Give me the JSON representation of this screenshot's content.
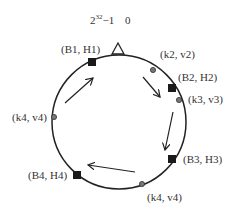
{
  "diagram": {
    "type": "consistent-hash-ring",
    "top_label": {
      "max": "2",
      "max_exp": "32",
      "max_suffix": "−1",
      "zero": "0"
    },
    "ring": {
      "cx": 119,
      "cy": 122,
      "r": 67,
      "stroke": "#222222"
    },
    "marker": {
      "shape": "triangle",
      "position": "top"
    },
    "nodes": [
      {
        "id": "B1",
        "label": "(B1, H1)",
        "x": 92,
        "y": 62
      },
      {
        "id": "B2",
        "label": "(B2, H2)",
        "x": 172,
        "y": 88
      },
      {
        "id": "B3",
        "label": "(B3, H3)",
        "x": 172,
        "y": 159
      },
      {
        "id": "B4",
        "label": "(B4, H4)",
        "x": 77,
        "y": 175
      }
    ],
    "keys": [
      {
        "id": "k2",
        "label": "(k2, v2)",
        "x": 153,
        "y": 70
      },
      {
        "id": "k3",
        "label": "(k3, v3)",
        "x": 179,
        "y": 100
      },
      {
        "id": "k4a",
        "label": "(k4, v4)",
        "x": 54,
        "y": 117
      },
      {
        "id": "k4b",
        "label": "(k4, v4)",
        "x": 142,
        "y": 184
      }
    ],
    "colors": {
      "node": "#1a1a1a",
      "key": "#777777",
      "key_stroke": "#333333",
      "text": "#333333",
      "line": "#222222"
    }
  }
}
